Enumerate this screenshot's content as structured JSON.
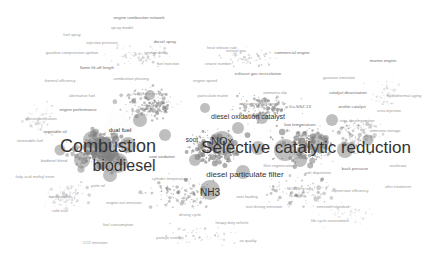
{
  "visualization": {
    "type": "bibliometric-network-map",
    "background_color": "#ffffff",
    "node_color": "#808080",
    "edge_color": "#c8c8c8",
    "label_color": "#3a3a3a",
    "width": 441,
    "height": 271
  },
  "major_labels": [
    {
      "text": "Combustion",
      "x": 108,
      "y": 146,
      "size": 18
    },
    {
      "text": "biodiesel",
      "x": 124,
      "y": 166,
      "size": 16
    },
    {
      "text": "Selective catalytic reduction",
      "x": 306,
      "y": 148,
      "size": 17
    },
    {
      "text": "NOx",
      "x": 222,
      "y": 141,
      "size": 11
    },
    {
      "text": "NH3",
      "x": 210,
      "y": 192,
      "size": 10
    },
    {
      "text": "diesel particulate filter",
      "x": 245,
      "y": 174,
      "size": 8
    },
    {
      "text": "diesel oxidation catalyst",
      "x": 248,
      "y": 116,
      "size": 7
    },
    {
      "text": "soot",
      "x": 192,
      "y": 139,
      "size": 6.5
    },
    {
      "text": "dual fuel",
      "x": 120,
      "y": 130,
      "size": 6
    }
  ],
  "minor_labels": [
    {
      "text": "engine combustion network",
      "x": 139,
      "y": 17,
      "size": 4.2
    },
    {
      "text": "spray model",
      "x": 122,
      "y": 27,
      "size": 4.0
    },
    {
      "text": "fuel spray",
      "x": 72,
      "y": 34,
      "size": 4.0
    },
    {
      "text": "injection pressure",
      "x": 102,
      "y": 42,
      "size": 4.0
    },
    {
      "text": "diesel spray",
      "x": 165,
      "y": 41,
      "size": 4.2
    },
    {
      "text": "gasoline compression ignition",
      "x": 72,
      "y": 52,
      "size": 4.0
    },
    {
      "text": "ignition delay",
      "x": 156,
      "y": 52,
      "size": 4.0
    },
    {
      "text": "heat release rate",
      "x": 222,
      "y": 47,
      "size": 4.0
    },
    {
      "text": "flame lift-off length",
      "x": 97,
      "y": 67,
      "size": 4.2
    },
    {
      "text": "fuel injection",
      "x": 168,
      "y": 63,
      "size": 4.0
    },
    {
      "text": "cetane number",
      "x": 218,
      "y": 63,
      "size": 4.0
    },
    {
      "text": "natural gas",
      "x": 236,
      "y": 50,
      "size": 4.0
    },
    {
      "text": "commercial engine",
      "x": 292,
      "y": 52,
      "size": 4.2
    },
    {
      "text": "marine engine",
      "x": 383,
      "y": 60,
      "size": 4.2
    },
    {
      "text": "thermal efficiency",
      "x": 60,
      "y": 80,
      "size": 4.0
    },
    {
      "text": "combustion phasing",
      "x": 131,
      "y": 78,
      "size": 4.0
    },
    {
      "text": "engine speed",
      "x": 205,
      "y": 80,
      "size": 4.0
    },
    {
      "text": "exhaust gas recirculation",
      "x": 258,
      "y": 73,
      "size": 4.2
    },
    {
      "text": "gaseous emission",
      "x": 339,
      "y": 77,
      "size": 4.0
    },
    {
      "text": "alternative fuel",
      "x": 82,
      "y": 95,
      "size": 4.0
    },
    {
      "text": "in-cylinder pressure",
      "x": 150,
      "y": 93,
      "size": 4.0
    },
    {
      "text": "particulate matter",
      "x": 213,
      "y": 95,
      "size": 4.0
    },
    {
      "text": "ammonia slip",
      "x": 275,
      "y": 92,
      "size": 4.0
    },
    {
      "text": "catalyst deactivation",
      "x": 348,
      "y": 92,
      "size": 4.2
    },
    {
      "text": "hydrothermal aging",
      "x": 404,
      "y": 95,
      "size": 4.0
    },
    {
      "text": "engine performance",
      "x": 78,
      "y": 109,
      "size": 4.2
    },
    {
      "text": "transesterification",
      "x": 41,
      "y": 118,
      "size": 4.0
    },
    {
      "text": "vegetable oil",
      "x": 55,
      "y": 131,
      "size": 4.2
    },
    {
      "text": "cylinder wall",
      "x": 158,
      "y": 105,
      "size": 4.0
    },
    {
      "text": "exhaust temperature",
      "x": 258,
      "y": 103,
      "size": 4.0
    },
    {
      "text": "Cu-SSZ-13",
      "x": 300,
      "y": 106,
      "size": 4.4
    },
    {
      "text": "zeolite catalyst",
      "x": 352,
      "y": 106,
      "size": 4.2
    },
    {
      "text": "urea injection",
      "x": 389,
      "y": 110,
      "size": 4.0
    },
    {
      "text": "low temperature",
      "x": 300,
      "y": 124,
      "size": 4.4
    },
    {
      "text": "urea decomposition",
      "x": 357,
      "y": 120,
      "size": 4.0
    },
    {
      "text": "ammonia storage",
      "x": 385,
      "y": 130,
      "size": 4.0
    },
    {
      "text": "soot oxidation",
      "x": 162,
      "y": 156,
      "size": 4.2
    },
    {
      "text": "biodiesel blend",
      "x": 54,
      "y": 160,
      "size": 4.0
    },
    {
      "text": "fatty acid methyl ester",
      "x": 35,
      "y": 176,
      "size": 4.0
    },
    {
      "text": "palm oil",
      "x": 98,
      "y": 185,
      "size": 4.0
    },
    {
      "text": "cylinder temperature",
      "x": 170,
      "y": 178,
      "size": 4.0
    },
    {
      "text": "filter regeneration",
      "x": 279,
      "y": 165,
      "size": 4.0
    },
    {
      "text": "ash deposition",
      "x": 318,
      "y": 172,
      "size": 4.0
    },
    {
      "text": "back pressure",
      "x": 355,
      "y": 168,
      "size": 4.2
    },
    {
      "text": "washcoat",
      "x": 398,
      "y": 165,
      "size": 4.0
    },
    {
      "text": "soot loading",
      "x": 247,
      "y": 196,
      "size": 4.0
    },
    {
      "text": "NO2/NOx ratio",
      "x": 300,
      "y": 188,
      "size": 4.0
    },
    {
      "text": "conversion efficiency",
      "x": 350,
      "y": 190,
      "size": 4.0
    },
    {
      "text": "after treatment",
      "x": 398,
      "y": 186,
      "size": 4.0
    },
    {
      "text": "engine out emission",
      "x": 124,
      "y": 202,
      "size": 4.0
    },
    {
      "text": "cold start",
      "x": 60,
      "y": 210,
      "size": 4.0
    },
    {
      "text": "driving cycle",
      "x": 190,
      "y": 214,
      "size": 4.0
    },
    {
      "text": "real driving emission",
      "x": 264,
      "y": 206,
      "size": 4.0
    },
    {
      "text": "emission standard",
      "x": 333,
      "y": 206,
      "size": 4.0
    },
    {
      "text": "fuel consumption",
      "x": 118,
      "y": 224,
      "size": 4.0
    },
    {
      "text": "heavy duty vehicle",
      "x": 232,
      "y": 222,
      "size": 4.0
    },
    {
      "text": "life cycle assessment",
      "x": 330,
      "y": 220,
      "size": 4.0
    },
    {
      "text": "particle number",
      "x": 170,
      "y": 237,
      "size": 4.0
    },
    {
      "text": "air quality",
      "x": 248,
      "y": 240,
      "size": 4.0
    },
    {
      "text": "CO2 emission",
      "x": 95,
      "y": 242,
      "size": 4.0
    },
    {
      "text": "nanoparticle",
      "x": 60,
      "y": 196,
      "size": 4.0
    },
    {
      "text": "renewable fuel",
      "x": 30,
      "y": 140,
      "size": 4.0
    }
  ]
}
